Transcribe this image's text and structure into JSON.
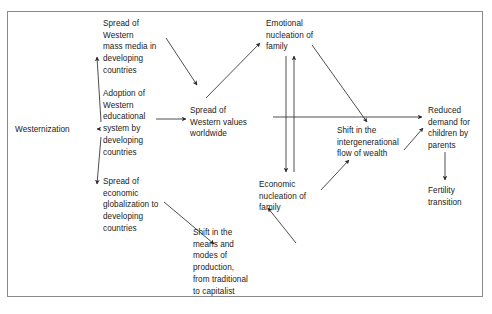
{
  "figure": {
    "type": "flow-diagram",
    "background_color": "#ffffff",
    "frame_color": "#8a8a8a",
    "line_color": "#3a3a3a",
    "text_color": "#1a1a1a"
  },
  "nodes": [
    {
      "id": "westernization",
      "label": "Westernization",
      "x": 15,
      "y": 124,
      "width": 84
    },
    {
      "id": "mass_media",
      "label": "Spread of\nWestern\nmass media in\ndeveloping\ncountries",
      "x": 103,
      "y": 18,
      "width": 76
    },
    {
      "id": "education",
      "label": "Adoption of\nWestern\neducational\nsystem by\ndeveloping\ncountries",
      "x": 103,
      "y": 88,
      "width": 76
    },
    {
      "id": "economic_globalization",
      "label": "Spread of\neconomic\nglobalization to\ndeveloping\ncountries",
      "x": 103,
      "y": 176,
      "width": 82
    },
    {
      "id": "western_values",
      "label": "Spread of\nWestern values\nworldwide",
      "x": 190,
      "y": 105,
      "width": 80
    },
    {
      "id": "modes_production",
      "label": "Shift in the\nmeans and\nmodes of\nproduction,\nfrom traditional\nto capitalist",
      "x": 193,
      "y": 227,
      "width": 80
    },
    {
      "id": "emotional_nucleation",
      "label": "Emotional\nnucleation of\nfamily",
      "x": 266,
      "y": 18,
      "width": 74
    },
    {
      "id": "economic_nucleation",
      "label": "Economic\nnucleation of\nfamily",
      "x": 259,
      "y": 179,
      "width": 74
    },
    {
      "id": "intergenerational_wealth",
      "label": "Shift in the\nintergenerational\nflow of wealth",
      "x": 337,
      "y": 125,
      "width": 84
    },
    {
      "id": "reduced_demand",
      "label": "Reduced\ndemand for\nchildren by\nparents",
      "x": 428,
      "y": 105,
      "width": 62
    },
    {
      "id": "fertility_transition",
      "label": "Fertility\ntransition",
      "x": 428,
      "y": 185,
      "width": 62
    }
  ],
  "edges": [
    {
      "id": "edge-westernization-mass-media",
      "from": "westernization",
      "to": "mass_media",
      "x1": 101,
      "y1": 122,
      "x2": 97,
      "y2": 57
    },
    {
      "id": "edge-westernization-education",
      "from": "westernization",
      "to": "education",
      "x1": 100,
      "y1": 129,
      "x2": 97,
      "y2": 129
    },
    {
      "id": "edge-westernization-economic-globalization",
      "from": "westernization",
      "to": "economic_globalization",
      "x1": 101,
      "y1": 137,
      "x2": 97,
      "y2": 184
    },
    {
      "id": "edge-mass-media-western-values",
      "from": "mass_media",
      "to": "western_values",
      "x1": 166,
      "y1": 38,
      "x2": 197,
      "y2": 85
    },
    {
      "id": "edge-education-western-values",
      "from": "education",
      "to": "western_values",
      "x1": 156,
      "y1": 119,
      "x2": 186,
      "y2": 119
    },
    {
      "id": "edge-economic-globalization-modes-production",
      "from": "economic_globalization",
      "to": "modes_production",
      "x1": 164,
      "y1": 202,
      "x2": 214,
      "y2": 244
    },
    {
      "id": "edge-western-values-emotional",
      "from": "western_values",
      "to": "emotional_nucleation",
      "x1": 206,
      "y1": 98,
      "x2": 260,
      "y2": 43
    },
    {
      "id": "edge-western-values-reduced-demand",
      "from": "western_values",
      "to": "reduced_demand",
      "x1": 273,
      "y1": 117,
      "x2": 422,
      "y2": 117
    },
    {
      "id": "edge-emotional-to-economic",
      "from": "emotional_nucleation",
      "to": "economic_nucleation",
      "x1": 286,
      "y1": 56,
      "x2": 286,
      "y2": 172
    },
    {
      "id": "edge-economic-to-emotional",
      "from": "economic_nucleation",
      "to": "emotional_nucleation",
      "x1": 294,
      "y1": 172,
      "x2": 294,
      "y2": 56
    },
    {
      "id": "edge-emotional-intergenerational",
      "from": "emotional_nucleation",
      "to": "intergenerational_wealth",
      "x1": 312,
      "y1": 45,
      "x2": 367,
      "y2": 122
    },
    {
      "id": "edge-economic-intergenerational",
      "from": "economic_nucleation",
      "to": "intergenerational_wealth",
      "x1": 321,
      "y1": 190,
      "x2": 349,
      "y2": 160
    },
    {
      "id": "edge-modes-production-economic-nucleation",
      "from": "modes_production",
      "to": "economic_nucleation",
      "x1": 296,
      "y1": 243,
      "x2": 268,
      "y2": 208
    },
    {
      "id": "edge-intergenerational-reduced-demand",
      "from": "intergenerational_wealth",
      "to": "reduced_demand",
      "x1": 404,
      "y1": 150,
      "x2": 423,
      "y2": 128
    },
    {
      "id": "edge-reduced-demand-fertility",
      "from": "reduced_demand",
      "to": "fertility_transition",
      "x1": 445,
      "y1": 152,
      "x2": 445,
      "y2": 180
    }
  ]
}
